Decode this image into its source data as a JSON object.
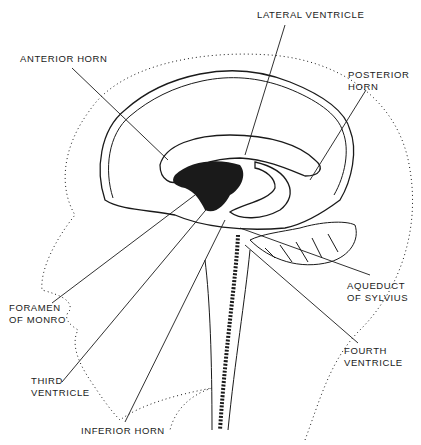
{
  "diagram": {
    "labels": [
      {
        "id": "lateral-ventricle",
        "lines": [
          "LATERAL VENTRICLE"
        ]
      },
      {
        "id": "anterior-horn",
        "lines": [
          "ANTERIOR HORN"
        ]
      },
      {
        "id": "posterior-horn",
        "lines": [
          "POSTERIOR",
          "HORN"
        ]
      },
      {
        "id": "aqueduct-of-sylvius",
        "lines": [
          "AQUEDUCT",
          "OF SYLVIUS"
        ]
      },
      {
        "id": "foramen-of-monro",
        "lines": [
          "FORAMEN",
          "OF MONRO"
        ]
      },
      {
        "id": "fourth-ventricle",
        "lines": [
          "FOURTH",
          "VENTRICLE"
        ]
      },
      {
        "id": "third-ventricle",
        "lines": [
          "THIRD",
          "VENTRICLE"
        ]
      },
      {
        "id": "inferior-horn",
        "lines": [
          "INFERIOR HORN"
        ]
      }
    ]
  },
  "colors": {
    "ink": "#1a1a1a",
    "background": "#ffffff"
  }
}
